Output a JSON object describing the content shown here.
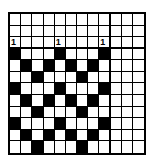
{
  "diagram": {
    "type": "weaving-draft-grid",
    "rows": 12,
    "cols": 12,
    "thick_col_divider_after": 9,
    "thick_row_divider_after": 3,
    "fill_color": "#000000",
    "empty_color": "#ffffff",
    "labels": [
      {
        "row": 3,
        "col": 1,
        "text": "1"
      },
      {
        "row": 3,
        "col": 5,
        "text": "1"
      },
      {
        "row": 3,
        "col": 9,
        "text": "1"
      }
    ],
    "filled_cells": {
      "4": [
        1,
        5,
        9
      ],
      "5": [
        2,
        4,
        6,
        8
      ],
      "6": [
        3,
        7
      ],
      "7": [
        1,
        5,
        9
      ],
      "8": [
        2,
        4,
        6,
        8
      ],
      "9": [
        3,
        7
      ],
      "10": [
        1,
        5,
        9
      ],
      "11": [
        2,
        4,
        6,
        8
      ],
      "12": [
        3,
        7
      ]
    }
  }
}
